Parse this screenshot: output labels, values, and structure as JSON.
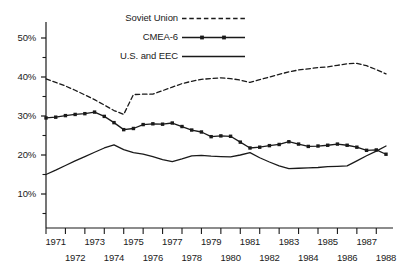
{
  "chart_data": {
    "type": "line",
    "title": "",
    "subtitle": "",
    "xlabel": "",
    "ylabel": "",
    "xlim": [
      1970.4,
      1988.2
    ],
    "ylim": [
      3.0,
      54.0
    ],
    "grid": false,
    "legend_position": "top-center",
    "y_ticks": [
      10,
      20,
      30,
      40,
      50
    ],
    "y_tick_labels": [
      "10%",
      "20%",
      "30%",
      "40%",
      "50%"
    ],
    "y_minor_ticks": [
      5,
      15,
      25,
      35,
      45
    ],
    "x_ticks_upper": [
      1971,
      1973,
      1975,
      1977,
      1979,
      1981,
      1983,
      1985,
      1987
    ],
    "x_ticks_lower": [
      1972,
      1974,
      1976,
      1978,
      1980,
      1982,
      1984,
      1986,
      1988
    ],
    "series": [
      {
        "name": "Soviet Union",
        "style": "dashed",
        "marker": "none",
        "color": "#1a1a1a",
        "x": [
          1970.5,
          1971,
          1971.5,
          1972,
          1972.5,
          1973,
          1973.5,
          1974,
          1974.5,
          1975,
          1975.5,
          1976,
          1976.5,
          1977,
          1977.5,
          1978,
          1978.5,
          1979,
          1979.5,
          1980,
          1980.5,
          1981,
          1981.5,
          1982,
          1982.5,
          1983,
          1983.5,
          1984,
          1984.5,
          1985,
          1985.5,
          1986,
          1986.5,
          1987,
          1987.5,
          1988
        ],
        "values": [
          39.5,
          38.6,
          37.7,
          36.6,
          35.4,
          34.2,
          32.8,
          31.4,
          30.4,
          35.5,
          35.6,
          35.6,
          36.5,
          37.4,
          38.3,
          38.9,
          39.4,
          39.6,
          39.8,
          39.6,
          39.2,
          38.6,
          39.3,
          40.0,
          40.7,
          41.3,
          41.8,
          42.1,
          42.4,
          42.6,
          43.0,
          43.4,
          43.5,
          42.9,
          41.9,
          40.8
        ]
      },
      {
        "name": "CMEA-6",
        "style": "solid",
        "marker": "square",
        "color": "#1a1a1a",
        "x": [
          1970.5,
          1971,
          1971.5,
          1972,
          1972.5,
          1973,
          1973.5,
          1974,
          1974.5,
          1975,
          1975.5,
          1976,
          1976.5,
          1977,
          1977.5,
          1978,
          1978.5,
          1979,
          1979.5,
          1980,
          1980.5,
          1981,
          1981.5,
          1982,
          1982.5,
          1983,
          1983.5,
          1984,
          1984.5,
          1985,
          1985.5,
          1986,
          1986.5,
          1987,
          1987.5,
          1988
        ],
        "values": [
          29.5,
          29.7,
          30.1,
          30.4,
          30.6,
          31.0,
          29.9,
          28.3,
          26.5,
          26.8,
          27.8,
          28.0,
          27.9,
          28.2,
          27.3,
          26.4,
          25.9,
          24.7,
          24.9,
          24.8,
          23.3,
          21.8,
          22.0,
          22.4,
          22.7,
          23.4,
          22.8,
          22.2,
          22.3,
          22.5,
          22.8,
          22.5,
          22.0,
          21.2,
          21.3,
          20.2
        ]
      },
      {
        "name": "U.S. and EEC",
        "style": "solid",
        "marker": "none",
        "color": "#1a1a1a",
        "x": [
          1970.5,
          1971,
          1971.5,
          1972,
          1972.5,
          1973,
          1973.5,
          1974,
          1974.5,
          1975,
          1975.5,
          1976,
          1976.5,
          1977,
          1977.5,
          1978,
          1978.5,
          1979,
          1979.5,
          1980,
          1980.5,
          1981,
          1981.5,
          1982,
          1982.5,
          1983,
          1983.5,
          1984,
          1984.5,
          1985,
          1985.5,
          1986,
          1986.5,
          1987,
          1987.5,
          1988
        ],
        "values": [
          15.0,
          16.1,
          17.3,
          18.5,
          19.6,
          20.7,
          21.8,
          22.6,
          21.4,
          20.6,
          20.2,
          19.6,
          18.8,
          18.3,
          19.0,
          19.8,
          19.9,
          19.7,
          19.6,
          19.5,
          20.0,
          20.6,
          19.3,
          18.2,
          17.2,
          16.5,
          16.6,
          16.7,
          16.8,
          17.0,
          17.1,
          17.2,
          18.5,
          19.8,
          21.0,
          22.3
        ]
      }
    ],
    "legend": [
      {
        "label": "Soviet Union",
        "style": "dashed",
        "marker": "none"
      },
      {
        "label": "CMEA-6",
        "style": "solid",
        "marker": "square"
      },
      {
        "label": "U.S. and EEC",
        "style": "solid",
        "marker": "none"
      }
    ]
  }
}
